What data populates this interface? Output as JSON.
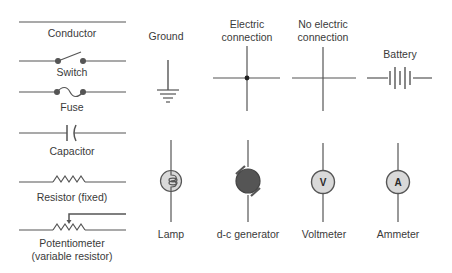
{
  "colors": {
    "line": "#555555",
    "text": "#3a3a3a",
    "meter_fill": "#d9d9d9",
    "generator_fill": "#555555"
  },
  "symbols": {
    "conductor": {
      "label": "Conductor"
    },
    "switch": {
      "label": "Switch"
    },
    "fuse": {
      "label": "Fuse"
    },
    "capacitor": {
      "label": "Capacitor"
    },
    "resistor": {
      "label": "Resistor (fixed)"
    },
    "potentiometer": {
      "label_line1": "Potentiometer",
      "label_line2": "(variable resistor)"
    },
    "ground": {
      "label": "Ground"
    },
    "electric_connection": {
      "label_line1": "Electric",
      "label_line2": "connection"
    },
    "no_electric_connection": {
      "label_line1": "No electric",
      "label_line2": "connection"
    },
    "battery": {
      "label": "Battery"
    },
    "lamp": {
      "label": "Lamp"
    },
    "dc_generator": {
      "label": "d-c generator"
    },
    "voltmeter": {
      "label": "Voltmeter",
      "letter": "V"
    },
    "ammeter": {
      "label": "Ammeter",
      "letter": "A"
    }
  }
}
